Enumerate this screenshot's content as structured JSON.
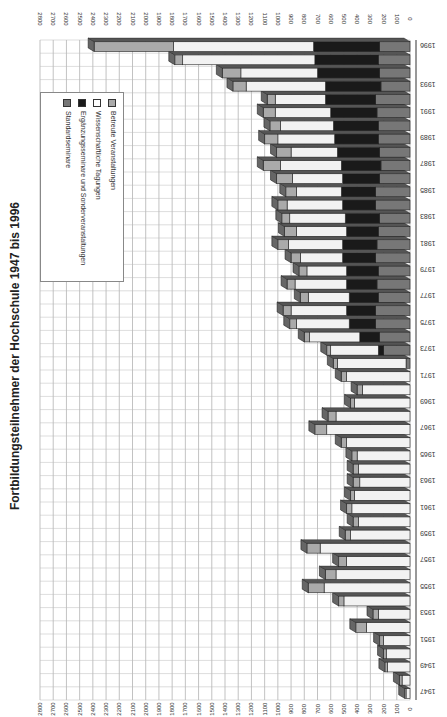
{
  "page": {
    "title": "Fortbildungsteilnehmer der Hochschule 1947 bis 1996"
  },
  "chart_data": {
    "type": "bar",
    "orientation": "stacked 3D bar, scanned page rotated 90°",
    "title": "Fortbildungsteilnehmer der Hochschule 1947 bis 1996",
    "xlabel": "",
    "ylabel": "",
    "ylim": [
      0,
      2800
    ],
    "y_ticks": [
      "0",
      "100",
      "200",
      "300",
      "400",
      "500",
      "600",
      "700",
      "800",
      "900",
      "1000",
      "1100",
      "1200",
      "1300",
      "1400",
      "1500",
      "1600",
      "1700",
      "1800",
      "1900",
      "2000",
      "2100",
      "2200",
      "2300",
      "2400",
      "2500",
      "2600",
      "2700",
      "2800"
    ],
    "x_tick_labels": [
      "1947",
      "1949",
      "1951",
      "1953",
      "1955",
      "1957",
      "1959",
      "1961",
      "1963",
      "1965",
      "1967",
      "1969",
      "1971",
      "1973",
      "1975",
      "1977",
      "1979",
      "1981",
      "1983",
      "1985",
      "1987",
      "1989",
      "1991",
      "1993",
      "1996"
    ],
    "grid": true,
    "legend_position": "inside upper-left",
    "categories": [
      "1947",
      "1948",
      "1949",
      "1950",
      "1951",
      "1952",
      "1953",
      "1954",
      "1955",
      "1956",
      "1957",
      "1958",
      "1959",
      "1960",
      "1961",
      "1962",
      "1963",
      "1964",
      "1965",
      "1966",
      "1967",
      "1968",
      "1969",
      "1970",
      "1971",
      "1972",
      "1973",
      "1974",
      "1975",
      "1976",
      "1977",
      "1978",
      "1979",
      "1980",
      "1981",
      "1982",
      "1983",
      "1984",
      "1985",
      "1986",
      "1987",
      "1988",
      "1989",
      "1990",
      "1991",
      "1992",
      "1993",
      "1994",
      "1995",
      "1996"
    ],
    "series": [
      {
        "name": "Standardseminare",
        "color": "#777777",
        "values": [
          0,
          0,
          0,
          0,
          0,
          0,
          0,
          0,
          0,
          0,
          0,
          0,
          0,
          0,
          0,
          0,
          0,
          0,
          0,
          0,
          0,
          0,
          0,
          0,
          0,
          30,
          200,
          230,
          260,
          260,
          240,
          250,
          240,
          260,
          250,
          240,
          230,
          260,
          260,
          230,
          220,
          230,
          240,
          240,
          250,
          260,
          220,
          230,
          240,
          230
        ]
      },
      {
        "name": "Ergänzungsseminare und Sonderveranstaltungen",
        "color": "#1a1a1a",
        "values": [
          0,
          0,
          0,
          0,
          0,
          0,
          0,
          0,
          0,
          0,
          0,
          0,
          0,
          0,
          0,
          0,
          0,
          0,
          0,
          0,
          0,
          0,
          0,
          0,
          0,
          0,
          40,
          150,
          200,
          220,
          220,
          230,
          240,
          250,
          260,
          240,
          260,
          250,
          260,
          280,
          300,
          320,
          330,
          340,
          350,
          380,
          420,
          470,
          480,
          500
        ]
      },
      {
        "name": "Wissenschaftliche Tagungen",
        "color": "#f2f2f2",
        "values": [
          30,
          60,
          170,
          180,
          200,
          330,
          240,
          500,
          650,
          560,
          480,
          680,
          450,
          390,
          440,
          420,
          380,
          390,
          400,
          480,
          630,
          560,
          420,
          360,
          480,
          520,
          360,
          380,
          400,
          420,
          310,
          390,
          300,
          320,
          410,
          380,
          420,
          420,
          340,
          380,
          460,
          350,
          430,
          400,
          420,
          380,
          600,
          580,
          1000,
          1060
        ]
      },
      {
        "name": "Betreute Veranstaltungen",
        "color": "#aaaaaa",
        "values": [
          10,
          20,
          20,
          20,
          30,
          80,
          40,
          40,
          120,
          80,
          60,
          100,
          40,
          40,
          40,
          30,
          50,
          40,
          40,
          40,
          90,
          60,
          30,
          40,
          40,
          30,
          30,
          40,
          50,
          60,
          60,
          60,
          60,
          70,
          80,
          90,
          60,
          70,
          80,
          120,
          130,
          110,
          100,
          80,
          90,
          60,
          100,
          140,
          60,
          600
        ]
      }
    ],
    "totals_approx": [
      40,
      80,
      190,
      200,
      230,
      410,
      280,
      540,
      770,
      640,
      540,
      780,
      490,
      430,
      480,
      450,
      430,
      430,
      440,
      520,
      720,
      620,
      450,
      400,
      520,
      580,
      630,
      800,
      910,
      960,
      830,
      930,
      840,
      900,
      1000,
      950,
      970,
      1000,
      940,
      1010,
      1110,
      1010,
      1100,
      1060,
      1110,
      1080,
      1340,
      1420,
      1780,
      2390
    ]
  },
  "legend": {
    "items": [
      {
        "label": "Betreute Veranstaltungen",
        "swatch": "#aaaaaa"
      },
      {
        "label": "Wissenschaftliche Tagungen",
        "swatch": "#ffffff"
      },
      {
        "label": "Ergänzungsseminare und Sonderveranstaltungen",
        "swatch": "#1a1a1a"
      },
      {
        "label": "Standardseminare",
        "swatch": "#777777"
      }
    ]
  }
}
